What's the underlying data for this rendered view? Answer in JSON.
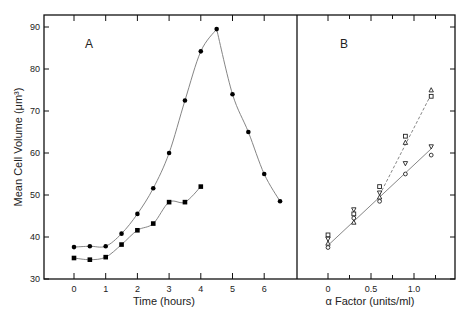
{
  "chart_data": [
    {
      "type": "line",
      "panel_label": "A",
      "title": "",
      "xlabel": "Time (hours)",
      "ylabel": "Mean Cell Volume (μm³)",
      "xticks": [
        0,
        1,
        2,
        3,
        4,
        5,
        6
      ],
      "yticks": [
        30,
        40,
        50,
        60,
        70,
        80,
        90
      ],
      "xlim": [
        -0.9,
        6.9
      ],
      "ylim": [
        30,
        92
      ],
      "grid": false,
      "series": [
        {
          "name": "circles (filled)",
          "marker": "filled-circle",
          "x": [
            0,
            0.5,
            1,
            1.5,
            2,
            2.5,
            3,
            3.5,
            4,
            4.5,
            5,
            5.5,
            6,
            6.5
          ],
          "y": [
            37.6,
            37.8,
            37.8,
            40.8,
            45.5,
            51.6,
            60.0,
            72.5,
            84.2,
            89.5,
            74.0,
            65.0,
            55.0,
            48.5
          ]
        },
        {
          "name": "squares (filled)",
          "marker": "filled-square",
          "x": [
            0,
            0.5,
            1,
            1.5,
            2,
            2.5,
            3,
            3.5,
            4
          ],
          "y": [
            35.0,
            34.6,
            35.2,
            38.2,
            41.6,
            43.2,
            48.3,
            48.3,
            52.0
          ]
        }
      ]
    },
    {
      "type": "scatter",
      "panel_label": "B",
      "title": "",
      "xlabel": "α Factor (units/ml)",
      "ylabel": "Mean Cell Volume (μm³)",
      "xticks": [
        0,
        0.5,
        1.0
      ],
      "xtick_labels": [
        "0",
        "0.5",
        "1.0"
      ],
      "minor_xticks": [
        0.25,
        0.75,
        1.25
      ],
      "xlim": [
        -0.3,
        1.48
      ],
      "ylim": [
        30,
        92
      ],
      "grid": false,
      "series": [
        {
          "name": "open squares",
          "marker": "open-square",
          "x": [
            0,
            0.3,
            0.6,
            0.9,
            1.2
          ],
          "y": [
            40.5,
            45.5,
            52.0,
            64.0,
            73.5
          ]
        },
        {
          "name": "open triangles",
          "marker": "open-triangle-up",
          "x": [
            0,
            0.3,
            0.6,
            0.9,
            1.2
          ],
          "y": [
            38.5,
            43.5,
            49.5,
            62.5,
            75.0
          ]
        },
        {
          "name": "open inverted triangles",
          "marker": "open-triangle-down",
          "x": [
            0,
            0.3,
            0.6,
            0.9,
            1.2
          ],
          "y": [
            39.5,
            46.5,
            50.5,
            57.5,
            61.5
          ]
        },
        {
          "name": "open circles",
          "marker": "open-circle",
          "x": [
            0,
            0.3,
            0.6,
            0.9,
            1.2
          ],
          "y": [
            37.5,
            44.5,
            48.5,
            55.0,
            59.5
          ]
        }
      ],
      "fit_lines": [
        {
          "style": "solid",
          "x": [
            0,
            1.2
          ],
          "y": [
            38.0,
            61.0
          ]
        },
        {
          "style": "dashed",
          "x": [
            0.6,
            1.2
          ],
          "y": [
            50.0,
            74.0
          ]
        }
      ]
    }
  ],
  "labels": {
    "panel_a": "A",
    "panel_b": "B",
    "y_axis": "Mean Cell Volume (μm³)",
    "x_axis_a": "Time (hours)",
    "x_axis_b": "α Factor (units/ml)"
  }
}
